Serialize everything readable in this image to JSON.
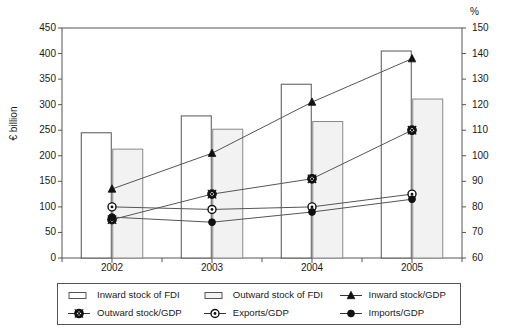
{
  "chart_data": {
    "type": "bar",
    "title": "",
    "subtitle": "",
    "xlabel": "",
    "ylabel": "€ billion",
    "y2label": "%",
    "categories": [
      "2002",
      "2003",
      "2004",
      "2005"
    ],
    "ylim": [
      0,
      450
    ],
    "yticks": [
      0,
      50,
      100,
      150,
      200,
      250,
      300,
      350,
      400,
      450
    ],
    "y2lim": [
      60,
      150
    ],
    "y2ticks": [
      60,
      70,
      80,
      90,
      100,
      110,
      120,
      130,
      140,
      150
    ],
    "grid": false,
    "legend_position": "bottom",
    "bar_series": [
      {
        "name": "Inward stock of FDI",
        "axis": "left",
        "unit": "€ billion",
        "fill": "#ffffff",
        "stroke": "#555555",
        "values": [
          245,
          278,
          340,
          405
        ]
      },
      {
        "name": "Outward stock of FDI",
        "axis": "left",
        "unit": "€ billion",
        "fill": "#f2f2f2",
        "stroke": "#888888",
        "values": [
          213,
          252,
          267,
          311
        ]
      }
    ],
    "line_series": [
      {
        "name": "Inward stock/GDP",
        "axis": "right",
        "unit": "%",
        "marker": "triangle",
        "stroke": "#555555",
        "values": [
          87,
          101,
          121,
          138
        ]
      },
      {
        "name": "Outward stock/GDP",
        "axis": "right",
        "unit": "%",
        "marker": "crossed-circle",
        "stroke": "#555555",
        "values": [
          75,
          85,
          91,
          110
        ]
      },
      {
        "name": "Exports/GDP",
        "axis": "right",
        "unit": "%",
        "marker": "open-circle",
        "stroke": "#555555",
        "values": [
          80,
          79,
          80,
          85
        ]
      },
      {
        "name": "Imports/GDP",
        "axis": "right",
        "unit": "%",
        "marker": "filled-circle",
        "stroke": "#555555",
        "values": [
          76,
          74,
          78,
          83
        ]
      }
    ]
  },
  "axes": {
    "left_unit_label": "€ billion",
    "right_unit_label": "%"
  },
  "legend": {
    "items": [
      {
        "label": "Inward stock of FDI",
        "marker": "bar-white"
      },
      {
        "label": "Outward stock of FDI",
        "marker": "bar-grey"
      },
      {
        "label": "Inward stock/GDP",
        "marker": "line-triangle"
      },
      {
        "label": "Outward stock/GDP",
        "marker": "line-crossed-circle"
      },
      {
        "label": "Exports/GDP",
        "marker": "line-open-circle"
      },
      {
        "label": "Imports/GDP",
        "marker": "line-filled-circle"
      }
    ]
  }
}
